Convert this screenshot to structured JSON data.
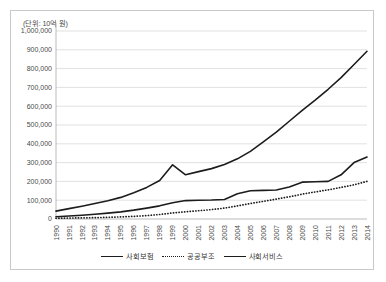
{
  "unit_note": "(단위: 10억 원)",
  "legend": {
    "items": [
      {
        "label": "사회보험",
        "style": "solid"
      },
      {
        "label": "공공부조",
        "style": "dotted"
      },
      {
        "label": "사회서비스",
        "style": "solid"
      }
    ]
  },
  "chart_data": {
    "type": "line",
    "title": "",
    "subtitle": "",
    "unit": "(단위: 10억 원)",
    "xlabel": "",
    "ylabel": "",
    "grid": true,
    "legend_position": "bottom",
    "ylim": [
      0,
      1000000
    ],
    "ytick_step": 100000,
    "ytick_labels": [
      "0",
      "100,000",
      "200,000",
      "300,000",
      "400,000",
      "500,000",
      "600,000",
      "700,000",
      "800,000",
      "900,000",
      "1,000,000"
    ],
    "yticks": [
      0,
      100000,
      200000,
      300000,
      400000,
      500000,
      600000,
      700000,
      800000,
      900000,
      1000000
    ],
    "categories": [
      "1990",
      "1991",
      "1992",
      "1993",
      "1994",
      "1995",
      "1996",
      "1997",
      "1998",
      "1999",
      "2000",
      "2001",
      "2002",
      "2003",
      "2004",
      "2005",
      "2006",
      "2007",
      "2008",
      "2009",
      "2010",
      "2011",
      "2012",
      "2013",
      "2014"
    ],
    "series": [
      {
        "name": "사회보험",
        "style": "solid",
        "values": [
          42000,
          55000,
          68000,
          82000,
          97000,
          115000,
          140000,
          168000,
          205000,
          288000,
          235000,
          252000,
          268000,
          290000,
          320000,
          360000,
          410000,
          462000,
          520000,
          578000,
          632000,
          690000,
          752000,
          822000,
          892000
        ]
      },
      {
        "name": "공공부조",
        "style": "dotted",
        "values": [
          4000,
          5000,
          6000,
          7000,
          9000,
          11000,
          14000,
          18000,
          24000,
          32000,
          38000,
          44000,
          50000,
          58000,
          70000,
          82000,
          94000,
          106000,
          118000,
          132000,
          144000,
          155000,
          168000,
          182000,
          200000
        ]
      },
      {
        "name": "사회서비스",
        "style": "solid",
        "values": [
          12000,
          16000,
          20000,
          25000,
          31000,
          38000,
          47000,
          58000,
          70000,
          86000,
          98000,
          100000,
          101000,
          104000,
          134000,
          150000,
          152000,
          154000,
          170000,
          196000,
          198000,
          200000,
          235000,
          300000,
          330000
        ]
      }
    ]
  }
}
